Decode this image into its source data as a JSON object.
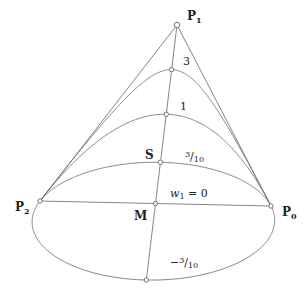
{
  "diagram": {
    "type": "rational-quadratic-bezier-family",
    "control_points": {
      "P0": {
        "label": "P",
        "sub": "0",
        "x": 271,
        "y": 206
      },
      "P1": {
        "label": "P",
        "sub": "1",
        "x": 177,
        "y": 25
      },
      "P2": {
        "label": "P",
        "sub": "2",
        "x": 40,
        "y": 201
      }
    },
    "points": {
      "M": {
        "label": "M"
      },
      "S": {
        "label": "S"
      }
    },
    "curves": [
      {
        "weight": 3,
        "label": "3"
      },
      {
        "weight": 1,
        "label": "1"
      },
      {
        "weight": 0.3,
        "label": "3/10"
      },
      {
        "weight": 0,
        "label": "w1 = 0"
      },
      {
        "weight": -0.3,
        "label": "−3/10"
      }
    ],
    "colors": {
      "line": "#777777",
      "text": "#222222"
    }
  }
}
